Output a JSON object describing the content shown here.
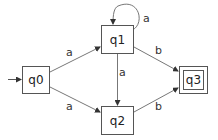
{
  "diagram": {
    "type": "finite-automaton",
    "colors": {
      "stroke": "#555555",
      "text": "#222222",
      "background": "#ffffff"
    },
    "states": [
      {
        "id": "q0",
        "label": "q0",
        "initial": true,
        "accepting": false
      },
      {
        "id": "q1",
        "label": "q1",
        "initial": false,
        "accepting": false
      },
      {
        "id": "q2",
        "label": "q2",
        "initial": false,
        "accepting": false
      },
      {
        "id": "q3",
        "label": "q3",
        "initial": false,
        "accepting": true
      }
    ],
    "transitions": [
      {
        "from": "q0",
        "to": "q1",
        "label": "a"
      },
      {
        "from": "q0",
        "to": "q2",
        "label": "a"
      },
      {
        "from": "q1",
        "to": "q1",
        "label": "a"
      },
      {
        "from": "q1",
        "to": "q2",
        "label": "a"
      },
      {
        "from": "q1",
        "to": "q3",
        "label": "b"
      },
      {
        "from": "q2",
        "to": "q3",
        "label": "b"
      }
    ]
  }
}
